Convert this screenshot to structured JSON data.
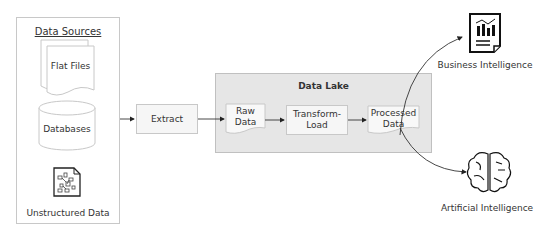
{
  "diagram": {
    "sources": {
      "title": "Data Sources",
      "items": [
        {
          "label": "Flat Files",
          "icon": "document-stack-icon"
        },
        {
          "label": "Databases",
          "icon": "database-cylinder-icon"
        },
        {
          "label": "Unstructured Data",
          "icon": "unstructured-document-icon"
        }
      ]
    },
    "extract": {
      "label": "Extract"
    },
    "lake": {
      "title": "Data Lake",
      "raw": {
        "line1": "Raw",
        "line2": "Data"
      },
      "transform": {
        "line1": "Transform-",
        "line2": "Load"
      },
      "processed": {
        "line1": "Processed",
        "line2": "Data"
      }
    },
    "outputs": [
      {
        "label": "Business Intelligence",
        "icon": "report-chart-icon"
      },
      {
        "label": "Artificial Intelligence",
        "icon": "brain-icon"
      }
    ],
    "colors": {
      "border": "#c8c8c8",
      "lake_fill": "#e6e6e6",
      "box_fill": "#f6f6f6",
      "text": "#333333",
      "arrow": "#222222"
    }
  }
}
